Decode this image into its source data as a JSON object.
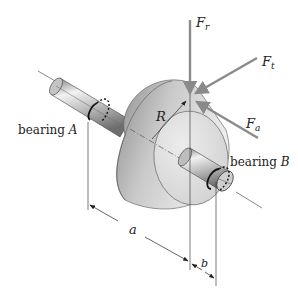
{
  "diagram": {
    "type": "mechanical-shaft-gear-forces",
    "labels": {
      "bearing_a_prefix": "bearing ",
      "bearing_a_var": "A",
      "bearing_b_prefix": "bearing ",
      "bearing_b_var": "B",
      "radius": "R",
      "force_radial_base": "F",
      "force_radial_sub": "r",
      "force_tangential_base": "F",
      "force_tangential_sub": "t",
      "force_axial_base": "F",
      "force_axial_sub": "a",
      "dim_a": "a",
      "dim_b": "b"
    },
    "colors": {
      "force_arrows": "#8a8a8a",
      "gear_light": "#e2e2e2",
      "gear_dark": "#9c9c9c",
      "shaft": "#b8b8b8",
      "lines": "#333333"
    }
  }
}
